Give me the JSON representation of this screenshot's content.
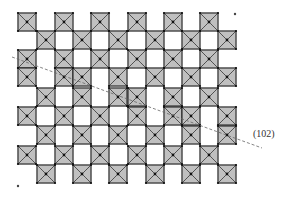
{
  "figure": {
    "type": "crystal-structure-projection",
    "square_size": 18,
    "colors": {
      "outline": "#222222",
      "hatch": "#777777",
      "fill": "#d8d8d8",
      "vertex": "#111111",
      "shear_line": "#666666"
    },
    "rows": [
      {
        "y": 13,
        "x": [
          18,
          55,
          91,
          128,
          164,
          200
        ]
      },
      {
        "y": 31,
        "x": [
          37,
          73,
          109,
          146,
          182,
          218
        ]
      },
      {
        "y": 50,
        "x": [
          18,
          55,
          91,
          128,
          164,
          200
        ]
      },
      {
        "y": 68,
        "x": [
          18,
          55,
          73,
          109,
          146,
          182,
          218
        ]
      },
      {
        "y": 88,
        "x": [
          37,
          73,
          109,
          128,
          164,
          200
        ]
      },
      {
        "y": 107,
        "x": [
          18,
          55,
          91,
          128,
          164,
          182,
          218
        ]
      },
      {
        "y": 126,
        "x": [
          37,
          73,
          109,
          146,
          182,
          218
        ]
      },
      {
        "y": 146,
        "x": [
          18,
          55,
          91,
          128,
          164,
          200
        ]
      },
      {
        "y": 165,
        "x": [
          37,
          73,
          109,
          146,
          182,
          218
        ]
      }
    ],
    "dots": [
      {
        "x": 235,
        "y": 14
      },
      {
        "x": 18,
        "y": 186
      }
    ],
    "shear_plane": {
      "x1": 12,
      "y1": 57,
      "x2": 262,
      "y2": 148,
      "label": "(102)",
      "label_x": 253,
      "label_y": 128
    }
  }
}
